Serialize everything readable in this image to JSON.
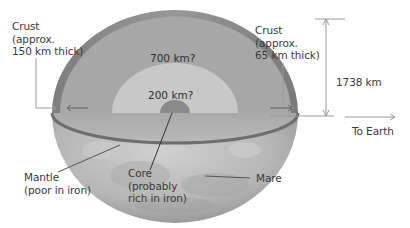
{
  "diagram": {
    "labels": {
      "crust_left": "Crust\n(approx.\n150 km thick)",
      "crust_right": "Crust\n(approx.\n65 km thick)",
      "radius": "1738 km",
      "to_earth": "To Earth",
      "upper_mantle_depth": "700 km?",
      "lower_mantle_depth": "200 km?",
      "mantle": "Mantle\n(poor in iron)",
      "core": "Core\n(probably\nrich in iron)",
      "mare": "Mare"
    },
    "colors": {
      "crust": "#8f8f8f",
      "upper_mantle": "#a9a9a9",
      "lower_mantle": "#c9c9c9",
      "core": "#8a8a8a",
      "cut_plane": "#b4b4b4",
      "surface": "#bdbdbd",
      "leader_line": "#9a9a9a"
    }
  }
}
